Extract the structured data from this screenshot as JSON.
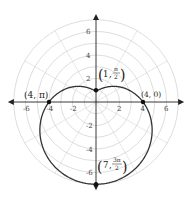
{
  "chart_data": {
    "type": "line",
    "coordinate_system": "polar",
    "title": "",
    "equation": "r = 4 - 3 sin(theta)",
    "curve": {
      "a": 4,
      "b": 3,
      "theta_range": [
        0,
        6.2832
      ]
    },
    "grid": {
      "on": true,
      "circle_radii": [
        1,
        2,
        3,
        4,
        5,
        6,
        7
      ],
      "ray_step_degrees": 30
    },
    "xlim": [
      -7.5,
      7.5
    ],
    "ylim": [
      -7.5,
      7.5
    ],
    "x_ticks": [
      {
        "value": -6,
        "label": "-6"
      },
      {
        "value": -4,
        "label": "-4"
      },
      {
        "value": -2,
        "label": "-2"
      },
      {
        "value": 2,
        "label": "2"
      },
      {
        "value": 4,
        "label": "4"
      },
      {
        "value": 6,
        "label": "6"
      }
    ],
    "y_ticks": [
      {
        "value": 6,
        "label": "6"
      },
      {
        "value": 4,
        "label": "4"
      },
      {
        "value": 2,
        "label": "2"
      },
      {
        "value": -2,
        "label": "-2"
      },
      {
        "value": -4,
        "label": "-4"
      },
      {
        "value": -6,
        "label": "-6"
      }
    ],
    "points": [
      {
        "r": 4,
        "theta": "0",
        "x": 4,
        "y": 0,
        "label": "(4, 0)"
      },
      {
        "r": 1,
        "theta": "π/2",
        "x": 0,
        "y": 1,
        "label": "(1, π/2)"
      },
      {
        "r": 4,
        "theta": "π",
        "x": -4,
        "y": 0,
        "label": "(4, π)"
      },
      {
        "r": 7,
        "theta": "3π/2",
        "x": 0,
        "y": -7,
        "label": "(7, 3π/2)"
      }
    ]
  },
  "annotations": {
    "p0": {
      "text": "(4, 0)"
    },
    "p1": {
      "r": "1",
      "num": "π",
      "den": "2"
    },
    "p2": {
      "text": "(4, π)"
    },
    "p3": {
      "r": "7",
      "num": "3π",
      "den": "2"
    }
  }
}
